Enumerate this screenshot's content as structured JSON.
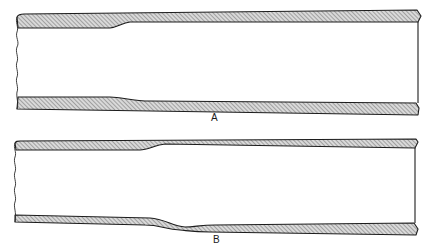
{
  "figure": {
    "labels": {
      "a": "A",
      "b": "B"
    },
    "colors": {
      "ink": "#1c1c1c",
      "hatch": "#8a8a8a",
      "background": "#ffffff"
    },
    "panels": [
      {
        "id": "A",
        "description": "Tube section with wall thinning (bore widening) toward the right on both top and bottom walls",
        "top_wall": "outer edge rising gently left to right; inner edge stepped up near x=120",
        "bottom_wall": "inner edge stepped down near x=130; outer edge straight"
      },
      {
        "id": "B",
        "description": "Tube section with top wall taper near x=150 and a localized dip/bulge in the bottom wall near x=185",
        "top_wall": "inner edge steps up near x=150",
        "bottom_wall": "wall bends downward around x=160-200 then continues"
      }
    ]
  }
}
